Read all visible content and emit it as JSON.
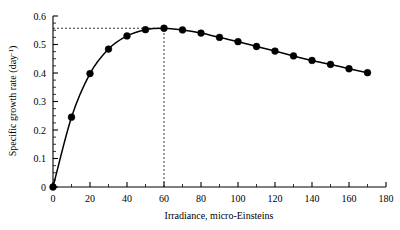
{
  "chart_data": {
    "type": "line",
    "title": "",
    "xlabel": "Irradiance, micro-Einsteins",
    "ylabel": "Specific growth rate (day-1)",
    "ylabel_main": "Specific growth rate (day",
    "ylabel_sup": "-1",
    "ylabel_tail": ")",
    "xlim": [
      0,
      180
    ],
    "ylim": [
      0,
      0.6
    ],
    "xticks": [
      0,
      20,
      40,
      60,
      80,
      100,
      120,
      140,
      160,
      180
    ],
    "xtick_labels": [
      "0",
      "20",
      "40",
      "60",
      "80",
      "100",
      "120",
      "140",
      "160",
      "180"
    ],
    "xminor_step": 10,
    "yticks": [
      0,
      0.1,
      0.2,
      0.3,
      0.4,
      0.5,
      0.6
    ],
    "ytick_labels": [
      "0",
      "0.1",
      "0.2",
      "0.3",
      "0.4",
      "0.5",
      "0.6"
    ],
    "yminor_step": 0.025,
    "grid": false,
    "legend": false,
    "marker": "filled-circle",
    "marker_size": 3.4,
    "line_color": "#000000",
    "x": [
      0,
      10,
      20,
      30,
      40,
      50,
      60,
      70,
      80,
      90,
      100,
      110,
      120,
      130,
      140,
      150,
      160,
      170
    ],
    "values": [
      0.0,
      0.245,
      0.398,
      0.484,
      0.53,
      0.552,
      0.557,
      0.551,
      0.54,
      0.525,
      0.51,
      0.493,
      0.477,
      0.46,
      0.444,
      0.43,
      0.415,
      0.401
    ],
    "series": [
      {
        "name": "Specific growth rate",
        "x": [
          0,
          10,
          20,
          30,
          40,
          50,
          60,
          70,
          80,
          90,
          100,
          110,
          120,
          130,
          140,
          150,
          160,
          170
        ],
        "values": [
          0.0,
          0.245,
          0.398,
          0.484,
          0.53,
          0.552,
          0.557,
          0.551,
          0.54,
          0.525,
          0.51,
          0.493,
          0.477,
          0.46,
          0.444,
          0.43,
          0.415,
          0.401
        ]
      }
    ],
    "annotations": [
      {
        "name": "optimum-horizontal-guide",
        "type": "dotted-horizontal-line",
        "y": 0.557,
        "x_from": 0,
        "x_to": 60
      },
      {
        "name": "optimum-vertical-guide",
        "type": "dashed-vertical-line",
        "x": 60,
        "y_from": 0,
        "y_to": 0.557
      }
    ]
  }
}
